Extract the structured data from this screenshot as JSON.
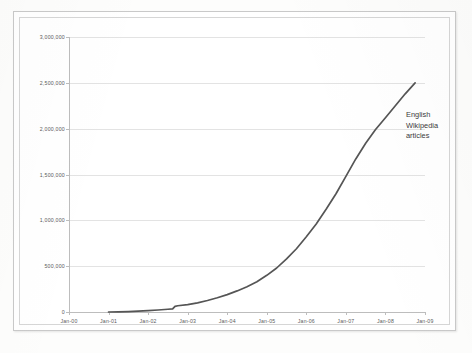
{
  "chart_data": {
    "type": "line",
    "title": "",
    "xlabel": "",
    "ylabel": "",
    "ylim": [
      0,
      3000000
    ],
    "grid": true,
    "legend_position": "inline-annotation",
    "annotation_lines": [
      "English",
      "Wikipedia",
      "articles"
    ],
    "series_name": "English Wikipedia articles",
    "series_color": "#555555",
    "gridline_color": "#e3e3e3",
    "axis_color": "#bdbdbd",
    "tick_text_color": "#5a5a5a",
    "y_ticks": [
      "0",
      "500,000",
      "1,000,000",
      "1,500,000",
      "2,000,000",
      "2,500,000",
      "3,000,000"
    ],
    "y_tick_values": [
      0,
      500000,
      1000000,
      1500000,
      2000000,
      2500000,
      3000000
    ],
    "x_ticks": [
      "Jan-00",
      "Jan-01",
      "Jan-02",
      "Jan-03",
      "Jan-04",
      "Jan-05",
      "Jan-06",
      "Jan-07",
      "Jan-08",
      "Jan-09"
    ],
    "x_tick_values": [
      2000.0,
      2001.0,
      2002.0,
      2003.0,
      2004.0,
      2005.0,
      2006.0,
      2007.0,
      2008.0,
      2009.0
    ],
    "xlim": [
      2000.0,
      2009.0
    ],
    "x": [
      2001.0,
      2001.25,
      2001.5,
      2001.75,
      2002.0,
      2002.25,
      2002.5,
      2002.62,
      2002.68,
      2002.75,
      2003.0,
      2003.25,
      2003.5,
      2003.75,
      2004.0,
      2004.25,
      2004.5,
      2004.75,
      2005.0,
      2005.25,
      2005.5,
      2005.75,
      2006.0,
      2006.25,
      2006.5,
      2006.75,
      2007.0,
      2007.25,
      2007.5,
      2007.75,
      2008.0,
      2008.25,
      2008.5,
      2008.75
    ],
    "values": [
      0,
      2000,
      5000,
      9000,
      15000,
      22000,
      30000,
      34000,
      62000,
      68000,
      80000,
      100000,
      125000,
      155000,
      190000,
      230000,
      275000,
      330000,
      400000,
      480000,
      580000,
      690000,
      820000,
      960000,
      1120000,
      1290000,
      1480000,
      1670000,
      1840000,
      1990000,
      2120000,
      2250000,
      2380000,
      2500000
    ]
  }
}
